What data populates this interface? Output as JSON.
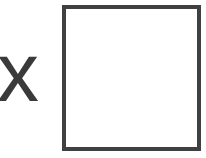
{
  "symbol": {
    "text": "x",
    "color": "#3a3a3a"
  },
  "checkbox": {
    "checked": false,
    "border_color": "#404040"
  }
}
